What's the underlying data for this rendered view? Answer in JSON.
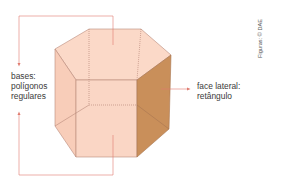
{
  "diagram": {
    "labels": {
      "bases": [
        "bases:",
        "polígonos",
        "regulares"
      ],
      "lateral_face": [
        "face lateral:",
        "retângulo"
      ]
    },
    "credit": "Figuras: © DAE",
    "colors": {
      "base_face": "#f9d2c0",
      "front_face": "#f7cdb9",
      "lateral_face_highlight": "#c98f5a",
      "edge": "#b98a7a",
      "hidden_edge": "#b07e70",
      "pointer": "#e07a6e"
    }
  }
}
